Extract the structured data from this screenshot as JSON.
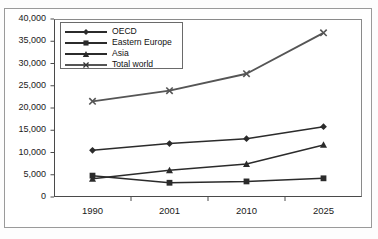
{
  "chart_data": {
    "type": "line",
    "title": "",
    "subtitle": "",
    "xlabel": "",
    "ylabel": "",
    "categories": [
      "1990",
      "2001",
      "2010",
      "2025"
    ],
    "ylim": [
      0,
      40000
    ],
    "ytick_values": [
      0,
      5000,
      10000,
      15000,
      20000,
      25000,
      30000,
      35000,
      40000
    ],
    "ytick_labels": [
      "0",
      "5,000",
      "10,000",
      "15,000",
      "20,000",
      "25,000",
      "30,000",
      "35,000",
      "40,000"
    ],
    "grid": false,
    "legend_position": "top-left-inside",
    "series": [
      {
        "name": "OECD",
        "marker": "diamond",
        "color": "#2b2b2b",
        "values": [
          10500,
          12000,
          13100,
          15800
        ]
      },
      {
        "name": "Eastern Europe",
        "marker": "square",
        "color": "#2b2b2b",
        "values": [
          4800,
          3200,
          3500,
          4200
        ]
      },
      {
        "name": "Asia",
        "marker": "triangle",
        "color": "#2b2b2b",
        "values": [
          4100,
          6000,
          7400,
          11700
        ]
      },
      {
        "name": "Total world",
        "marker": "cross",
        "color": "#555555",
        "values": [
          21500,
          23900,
          27700,
          36900
        ]
      }
    ]
  },
  "axes": {
    "y_axis_name": "y-axis",
    "x_axis_name": "x-axis"
  },
  "legend": {
    "items": [
      {
        "label": "OECD"
      },
      {
        "label": "Eastern Europe"
      },
      {
        "label": "Asia"
      },
      {
        "label": "Total world"
      }
    ]
  }
}
